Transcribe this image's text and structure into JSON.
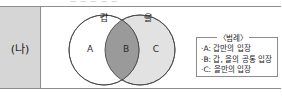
{
  "clipped_header_text": "ㅡ ㅡ ㅡ ㅡ ㅡ",
  "row": {
    "label": "(나)"
  },
  "venn": {
    "set_left_label": "갑",
    "set_right_label": "을",
    "regions": [
      {
        "id": "A",
        "label": "A",
        "fill": "#ffffff"
      },
      {
        "id": "B",
        "label": "B",
        "fill": "#9a9a9a"
      },
      {
        "id": "C",
        "label": "C",
        "fill": "#e2e2e2"
      }
    ],
    "stroke_color": "#4a4a4a"
  },
  "legend": {
    "title": "〈범례〉",
    "items": [
      "·A: 갑만의 입장",
      "·B: 갑, 을의 공통 입장",
      "·C: 을만의 입장"
    ]
  }
}
